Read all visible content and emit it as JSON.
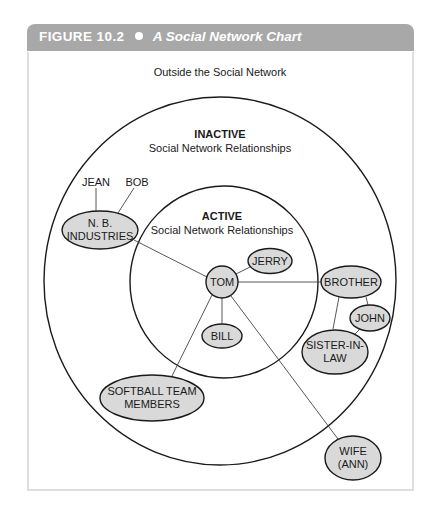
{
  "figure": {
    "label": "FIGURE",
    "number": "10.2",
    "title": "A Social Network Chart",
    "header_color": "#a8a8a8"
  },
  "regions": {
    "outside": "Outside the Social Network",
    "inactive_title": "INACTIVE",
    "inactive_sub": "Social Network Relationships",
    "active_title": "ACTIVE",
    "active_sub": "Social Network Relationships"
  },
  "nodes": {
    "tom": "TOM",
    "jerry": "JERRY",
    "bill": "BILL",
    "brother": "BROTHER",
    "john": "JOHN",
    "sister_l1": "SISTER-IN-",
    "sister_l2": "LAW",
    "nb_l1": "N. B.",
    "nb_l2": "INDUSTRIES",
    "jean": "JEAN",
    "bob": "BOB",
    "softball_l1": "SOFTBALL TEAM",
    "softball_l2": "MEMBERS",
    "wife_l1": "WIFE",
    "wife_l2": "(ANN)"
  },
  "colors": {
    "node_fill": "#d9d9d9",
    "stroke": "#1a1a1a"
  }
}
